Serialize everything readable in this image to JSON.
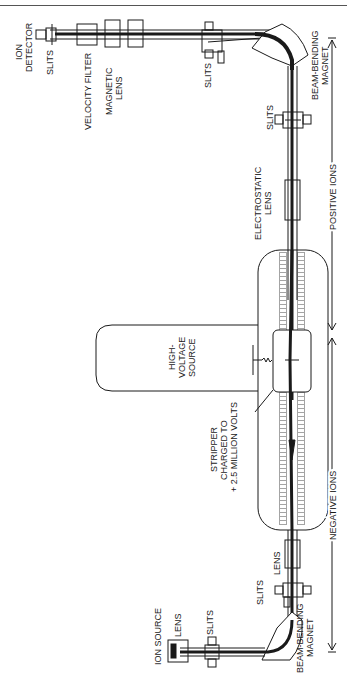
{
  "diagram": {
    "type": "tandem-accelerator-schematic",
    "labels": {
      "ion_detector_1": "ION",
      "ion_detector_2": "DETECTOR",
      "slits_detector": "SLITS",
      "velocity_filter": "VELOCITY FILTER",
      "magnetic_lens_1": "MAGNETIC",
      "magnetic_lens_2": "LENS",
      "slits_top_magnet": "SLITS",
      "beam_bending_magnet_top_1": "BEAM-BENDING",
      "beam_bending_magnet_top_2": "MAGNET",
      "slits_upper": "SLITS",
      "electrostatic_lens_1": "ELECTROSTATIC",
      "electrostatic_lens_2": "LENS",
      "positive_ions": "POSITIVE IONS",
      "high_voltage_1": "HIGH-",
      "high_voltage_2": "VOLTAGE",
      "high_voltage_3": "SOURCE",
      "stripper_1": "STRIPPER",
      "stripper_2": "CHARGED TO",
      "stripper_3": "+ 2.5 MILLION VOLTS",
      "negative_ions": "NEGATIVE IONS",
      "lens_lower": "LENS",
      "slits_lower": "SLITS",
      "ion_source": "ION SOURCE",
      "lens_source": "LENS",
      "slits_source": "SLITS",
      "beam_bending_magnet_bottom_1": "BEAM-BENDING",
      "beam_bending_magnet_bottom_2": "MAGNET"
    },
    "colors": {
      "ink": "#1a1a1a",
      "paper": "#ffffff"
    }
  }
}
